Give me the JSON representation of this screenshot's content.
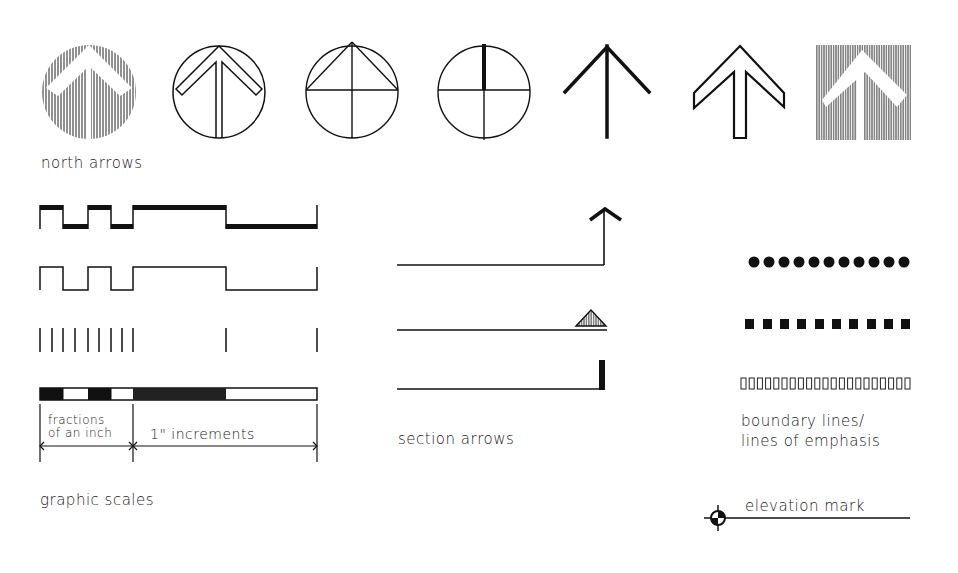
{
  "colors": {
    "ink": "#111111",
    "paper": "#ffffff"
  },
  "labels": {
    "north_arrows": "north arrows",
    "graphic_scales": "graphic scales",
    "fractions_line1": "fractions",
    "fractions_line2": "of an inch",
    "increments": "1\" increments",
    "section_arrows": "section arrows",
    "boundary_line1": "boundary lines/",
    "boundary_line2": "lines of emphasis",
    "elevation_mark": "elevation mark"
  },
  "north_arrows": {
    "count": 7,
    "variants": [
      "hatched-circle",
      "outline-circle",
      "triangle-circle",
      "quadrant-bar-circle",
      "simple-arrow",
      "outline-arrow",
      "hatched-square"
    ]
  },
  "graphic_scales": {
    "count": 4,
    "variants": [
      "filled-alternating",
      "outline-alternating",
      "tick-marks",
      "filled-bar"
    ],
    "fraction_divisions": 4,
    "inch_divisions": 2
  },
  "section_arrows": {
    "count": 3,
    "variants": [
      "chevron",
      "triangle",
      "bar"
    ]
  },
  "boundary_lines": {
    "dots": 11,
    "squares": 10,
    "open_rects": 21
  }
}
